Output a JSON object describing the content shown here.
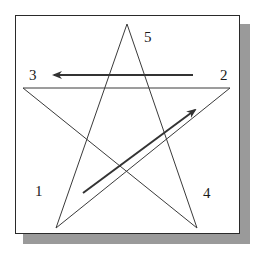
{
  "diagram": {
    "type": "pentagram-stroke-order",
    "frame": {
      "border_color": "#2a2a2a",
      "shadow_color": "#9a9a9a",
      "background": "#ffffff"
    },
    "stroke_color": "#3a3a3a",
    "arrow_color": "#333333",
    "points": [
      {
        "id": "1",
        "label": "1",
        "x": 56,
        "y": 228
      },
      {
        "id": "2",
        "label": "2",
        "x": 230,
        "y": 88
      },
      {
        "id": "3",
        "label": "3",
        "x": 23,
        "y": 88
      },
      {
        "id": "4",
        "label": "4",
        "x": 197,
        "y": 228
      },
      {
        "id": "5",
        "label": "5",
        "x": 127,
        "y": 24
      }
    ],
    "labels": [
      {
        "text": "1",
        "x": 35,
        "y": 184
      },
      {
        "text": "2",
        "x": 220,
        "y": 68
      },
      {
        "text": "3",
        "x": 29,
        "y": 68
      },
      {
        "text": "4",
        "x": 203,
        "y": 186
      },
      {
        "text": "5",
        "x": 144,
        "y": 30
      }
    ],
    "edges": [
      {
        "from": "1",
        "to": "2"
      },
      {
        "from": "2",
        "to": "3"
      },
      {
        "from": "3",
        "to": "4"
      },
      {
        "from": "4",
        "to": "5"
      },
      {
        "from": "5",
        "to": "1"
      }
    ],
    "arrows": [
      {
        "name": "direction-arrow-1-to-2",
        "x1": 83,
        "y1": 193,
        "x2": 195,
        "y2": 110
      },
      {
        "name": "direction-arrow-2-to-3",
        "x1": 193,
        "y1": 75,
        "x2": 54,
        "y2": 75
      }
    ]
  }
}
